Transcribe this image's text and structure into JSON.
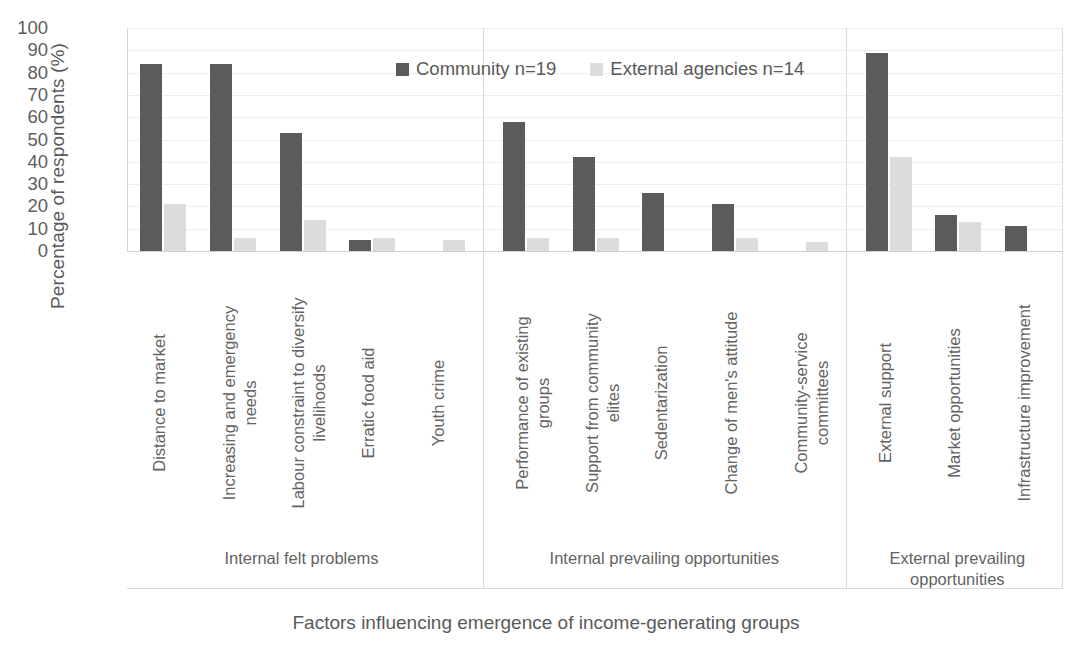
{
  "chart_data": {
    "type": "bar",
    "title": "",
    "xlabel": "Factors influencing emergence of income-generating groups",
    "ylabel": "Percentage of respondents (%)",
    "ylim": [
      0,
      100
    ],
    "ytick_step": 10,
    "yticks": [
      "100",
      "90",
      "80",
      "70",
      "60",
      "50",
      "40",
      "30",
      "20",
      "10",
      "0"
    ],
    "grid": "horizontal",
    "legend_position": "top-center",
    "colors": {
      "community": "#5b5b5b",
      "external_agencies": "#dcdcdc",
      "gridline": "#ededed",
      "text": "#5a5a5a"
    },
    "categories": [
      "Distance to market",
      "Increasing and emergency\nneeds",
      "Labour constraint to diversify\nlivelihoods",
      "Erratic food aid",
      "Youth crime",
      "Performance of existing\ngroups",
      "Support from community\nelites",
      "Sedentarization",
      "Change of men's attitude",
      "Community-service\ncommittees",
      "External support",
      "Market opportunities",
      "Infrastructure improvement"
    ],
    "series": [
      {
        "name": "Community n=19",
        "color": "#5b5b5b",
        "values": [
          84,
          84,
          53,
          5,
          0,
          58,
          42,
          26,
          21,
          0,
          89,
          16,
          11
        ]
      },
      {
        "name": "External agencies n=14",
        "color": "#dcdcdc",
        "values": [
          21,
          6,
          14,
          6,
          5,
          6,
          6,
          0,
          6,
          4,
          42,
          13,
          0
        ]
      }
    ],
    "groups": [
      {
        "label": "Internal felt problems",
        "categories": 5
      },
      {
        "label": "Internal prevailing opportunities",
        "categories": 5
      },
      {
        "label": "External prevailing\nopportunities",
        "categories": 3
      }
    ]
  }
}
